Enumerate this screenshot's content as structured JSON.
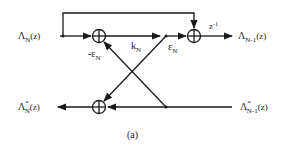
{
  "diagram": {
    "caption": "(a)",
    "colors": {
      "ink": "#1a1a1a",
      "background": "#ffffff"
    },
    "inputs": {
      "top_in": {
        "base": "Λ",
        "sub": "N",
        "arg": "(z)"
      },
      "bottom_in": {
        "base": "Λ",
        "sup": "*",
        "sub": "N-1",
        "arg": "(z)"
      }
    },
    "outputs": {
      "top_out": {
        "base": "Λ",
        "sub": "N-1",
        "arg": "(z)"
      },
      "bottom_out": {
        "base": "Λ",
        "sup": "*",
        "sub": "N",
        "arg": "(z)"
      }
    },
    "gains": {
      "neg_eps": {
        "base": "-ε",
        "sub": "N"
      },
      "k": {
        "base": "k",
        "sub": "N"
      },
      "eps": {
        "base": "ε",
        "sub": "N"
      }
    },
    "delay": {
      "base": "z",
      "sup": "-1"
    },
    "nodes": [
      {
        "id": "sum-top-left",
        "type": "summer",
        "symbol": "⊕"
      },
      {
        "id": "sum-top-right",
        "type": "summer",
        "symbol": "⊕"
      },
      {
        "id": "sum-bottom",
        "type": "summer",
        "symbol": "⊕"
      }
    ]
  }
}
